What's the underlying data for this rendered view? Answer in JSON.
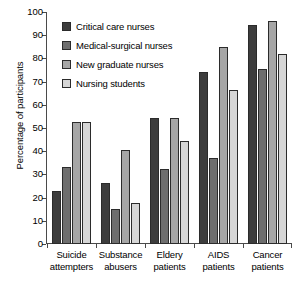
{
  "chart_data": {
    "type": "bar",
    "title": "",
    "xlabel": "",
    "ylabel": "Percentage of participants",
    "ylim": [
      0,
      100
    ],
    "yticks": [
      0,
      10,
      20,
      30,
      40,
      50,
      60,
      70,
      80,
      90,
      100
    ],
    "grid": false,
    "legend_position": "upper-left-inside",
    "categories": [
      "Suicide attempters",
      "Substance abusers",
      "Eldery patients",
      "AIDS patients",
      "Cancer patients"
    ],
    "category_lines": [
      [
        "Suicide",
        "attempters"
      ],
      [
        "Substance",
        "abusers"
      ],
      [
        "Eldery",
        "patients"
      ],
      [
        "AIDS",
        "patients"
      ],
      [
        "Cancer",
        "patients"
      ]
    ],
    "series": [
      {
        "name": "Critical care nurses",
        "color": "#3d3d3d",
        "values": [
          23,
          26.5,
          54.5,
          74,
          94.5
        ]
      },
      {
        "name": "Medical-surgical nurses",
        "color": "#6e6e6e",
        "values": [
          33,
          15,
          32.5,
          37,
          75.5
        ]
      },
      {
        "name": "New graduate nurses",
        "color": "#a6a6a6",
        "values": [
          52.5,
          40.5,
          54.5,
          85,
          96
        ]
      },
      {
        "name": "Nursing students",
        "color": "#d6d6d6",
        "values": [
          52.5,
          17.5,
          44.5,
          66.5,
          82
        ]
      }
    ]
  }
}
